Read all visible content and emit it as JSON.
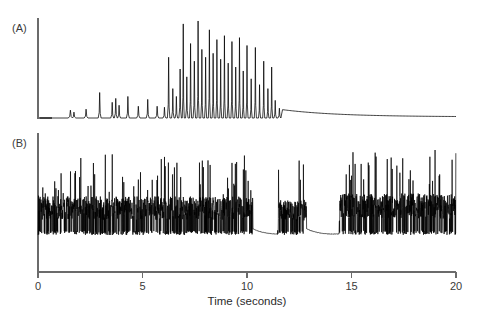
{
  "figure": {
    "background_color": "#ffffff",
    "trace_color": "#000000",
    "axis_color": "#6b6b6b",
    "panels": [
      {
        "id": "A",
        "label": "(A)"
      },
      {
        "id": "B",
        "label": "(B)"
      }
    ]
  },
  "axis": {
    "x_title": "Time (seconds)",
    "x_ticks": [
      {
        "value": 0,
        "label": "0"
      },
      {
        "value": 5,
        "label": "5"
      },
      {
        "value": 10,
        "label": "10"
      },
      {
        "value": 15,
        "label": "15"
      },
      {
        "value": 20,
        "label": "20"
      }
    ],
    "x_min": 0,
    "x_max": 20,
    "x_unit": "seconds",
    "grid": false
  },
  "chart_data": {
    "type": "line",
    "title": "",
    "subtitle": "",
    "xlabel": "Time (seconds)",
    "ylabel": "",
    "xlim": [
      0,
      20
    ],
    "grid": false,
    "legend": "none",
    "annotations": [
      "(A)",
      "(B)"
    ],
    "series": [
      {
        "name": "(A)",
        "panel": "A",
        "description": "Spike-train trace with sparse small events before 6 s, a dense burst of tall narrow spikes between 6.2 and 11 s, then a slowly decaying baseline tail to 20 s.",
        "baseline": 0,
        "ylim": [
          0,
          1
        ],
        "peaks": [
          {
            "t": 1.55,
            "amplitude": 0.08,
            "width": 0.1
          },
          {
            "t": 1.72,
            "amplitude": 0.06,
            "width": 0.09
          },
          {
            "t": 2.3,
            "amplitude": 0.09,
            "width": 0.09
          },
          {
            "t": 2.95,
            "amplitude": 0.26,
            "width": 0.07
          },
          {
            "t": 3.55,
            "amplitude": 0.16,
            "width": 0.07
          },
          {
            "t": 3.72,
            "amplitude": 0.2,
            "width": 0.07
          },
          {
            "t": 3.88,
            "amplitude": 0.13,
            "width": 0.07
          },
          {
            "t": 4.3,
            "amplitude": 0.22,
            "width": 0.07
          },
          {
            "t": 4.8,
            "amplitude": 0.12,
            "width": 0.08
          },
          {
            "t": 5.25,
            "amplitude": 0.19,
            "width": 0.07
          },
          {
            "t": 5.7,
            "amplitude": 0.12,
            "width": 0.08
          },
          {
            "t": 6.05,
            "amplitude": 0.11,
            "width": 0.07
          },
          {
            "t": 6.25,
            "amplitude": 0.62,
            "width": 0.06
          },
          {
            "t": 6.45,
            "amplitude": 0.3,
            "width": 0.06
          },
          {
            "t": 6.62,
            "amplitude": 0.22,
            "width": 0.06
          },
          {
            "t": 6.8,
            "amplitude": 0.5,
            "width": 0.06
          },
          {
            "t": 6.95,
            "amplitude": 0.96,
            "width": 0.05
          },
          {
            "t": 7.12,
            "amplitude": 0.42,
            "width": 0.06
          },
          {
            "t": 7.3,
            "amplitude": 0.76,
            "width": 0.05
          },
          {
            "t": 7.48,
            "amplitude": 0.58,
            "width": 0.06
          },
          {
            "t": 7.66,
            "amplitude": 0.99,
            "width": 0.05
          },
          {
            "t": 7.84,
            "amplitude": 0.7,
            "width": 0.05
          },
          {
            "t": 8.02,
            "amplitude": 0.62,
            "width": 0.05
          },
          {
            "t": 8.2,
            "amplitude": 0.9,
            "width": 0.05
          },
          {
            "t": 8.38,
            "amplitude": 0.66,
            "width": 0.05
          },
          {
            "t": 8.56,
            "amplitude": 0.8,
            "width": 0.05
          },
          {
            "t": 8.74,
            "amplitude": 0.6,
            "width": 0.05
          },
          {
            "t": 8.92,
            "amplitude": 0.84,
            "width": 0.05
          },
          {
            "t": 9.1,
            "amplitude": 0.56,
            "width": 0.05
          },
          {
            "t": 9.28,
            "amplitude": 0.78,
            "width": 0.05
          },
          {
            "t": 9.46,
            "amplitude": 0.52,
            "width": 0.05
          },
          {
            "t": 9.64,
            "amplitude": 0.82,
            "width": 0.05
          },
          {
            "t": 9.82,
            "amplitude": 0.48,
            "width": 0.05
          },
          {
            "t": 10.0,
            "amplitude": 0.74,
            "width": 0.05
          },
          {
            "t": 10.2,
            "amplitude": 0.4,
            "width": 0.05
          },
          {
            "t": 10.4,
            "amplitude": 0.72,
            "width": 0.05
          },
          {
            "t": 10.6,
            "amplitude": 0.34,
            "width": 0.05
          },
          {
            "t": 10.8,
            "amplitude": 0.58,
            "width": 0.05
          },
          {
            "t": 11.0,
            "amplitude": 0.3,
            "width": 0.05
          },
          {
            "t": 11.18,
            "amplitude": 0.52,
            "width": 0.05
          },
          {
            "t": 11.35,
            "amplitude": 0.18,
            "width": 0.06
          },
          {
            "t": 11.55,
            "amplitude": 0.1,
            "width": 0.07
          }
        ],
        "tail": {
          "start_t": 11.7,
          "start_amplitude": 0.085,
          "end_t": 20.0,
          "end_amplitude": 0.012
        }
      },
      {
        "name": "(B)",
        "panel": "B",
        "description": "High-frequency noisy burst trace. Continuous dense activity from 0 to about 10.3 s, a quiet flat interval, a short burst near 11.5-12.8 s, a second quiet interval, then dense activity resuming at about 14.4 s and continuing to 20 s, including an isolated very tall spike near 19 s.",
        "baseline": 0,
        "ylim": [
          0,
          1
        ],
        "bursts": [
          {
            "start_t": 0.0,
            "end_t": 10.28,
            "mean_amplitude": 0.42,
            "max_amplitude": 0.95
          },
          {
            "start_t": 11.45,
            "end_t": 12.85,
            "mean_amplitude": 0.38,
            "max_amplitude": 0.9
          },
          {
            "start_t": 14.4,
            "end_t": 20.0,
            "mean_amplitude": 0.45,
            "max_amplitude": 1.0
          }
        ],
        "quiet_intervals": [
          {
            "start_t": 10.28,
            "end_t": 11.45
          },
          {
            "start_t": 12.85,
            "end_t": 14.4
          }
        ],
        "isolated_spikes": [
          {
            "t": 19.0,
            "amplitude": 1.0
          }
        ]
      }
    ]
  }
}
